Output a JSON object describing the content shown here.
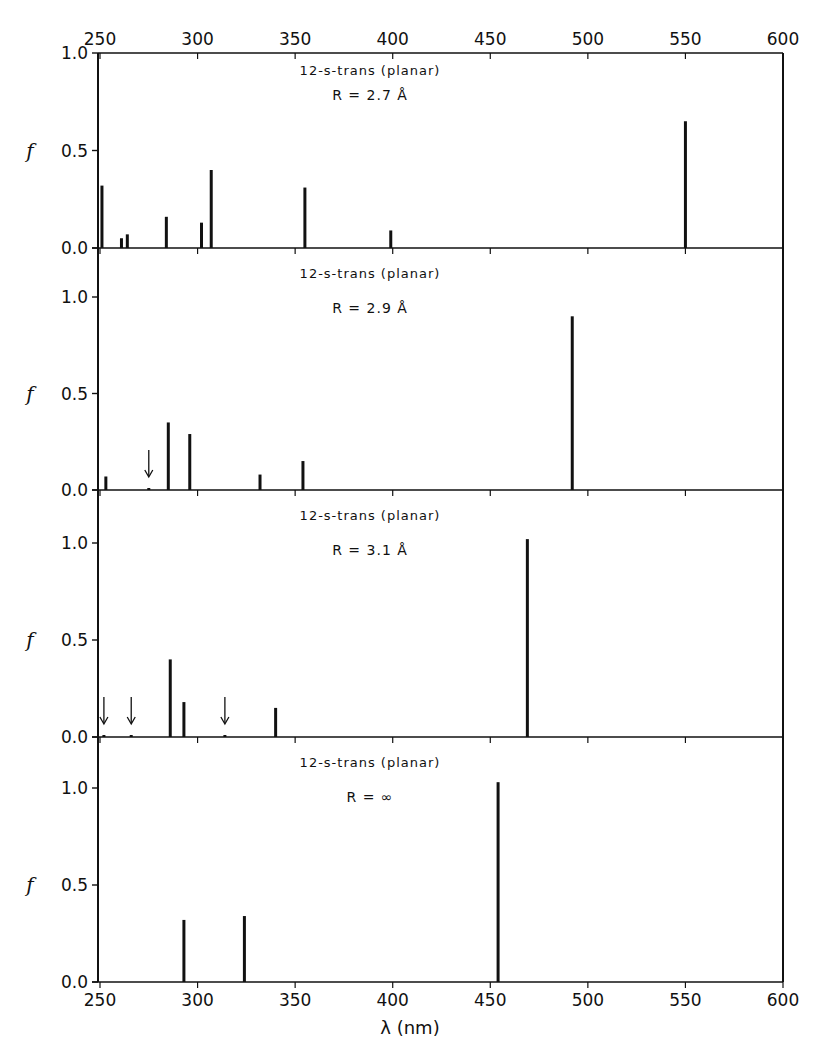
{
  "chart_data": {
    "type": "bar",
    "subtype": "stick-spectrum",
    "title": "",
    "xlabel": "λ (nm)",
    "ylabel": "f",
    "xlim": [
      250,
      600
    ],
    "x_ticks": [
      250,
      300,
      350,
      400,
      450,
      500,
      550,
      600
    ],
    "x_tick_labels": [
      "250",
      "300",
      "350",
      "400",
      "450",
      "500",
      "550",
      "600"
    ],
    "grid": false,
    "legend": null,
    "panels": [
      {
        "id": "panel-1",
        "annotation_line1": "12-s-trans (planar)",
        "annotation_line2": "R = 2.7 Å",
        "ylim": [
          0,
          1.0
        ],
        "y_ticks": [
          0.0,
          0.5,
          1.0
        ],
        "y_tick_labels": [
          "0.0",
          "0.5",
          "1.0"
        ],
        "top_x_axis_labels": true,
        "lines": [
          {
            "x": 251,
            "f": 0.32
          },
          {
            "x": 261,
            "f": 0.05
          },
          {
            "x": 264,
            "f": 0.07
          },
          {
            "x": 284,
            "f": 0.16
          },
          {
            "x": 302,
            "f": 0.13
          },
          {
            "x": 307,
            "f": 0.4
          },
          {
            "x": 355,
            "f": 0.31
          },
          {
            "x": 399,
            "f": 0.09
          },
          {
            "x": 550,
            "f": 0.65
          }
        ],
        "arrows": []
      },
      {
        "id": "panel-2",
        "annotation_line1": "12-s-trans (planar)",
        "annotation_line2": "R = 2.9 Å",
        "ylim": [
          0,
          1.2
        ],
        "y_ticks": [
          0.0,
          0.5,
          1.0
        ],
        "y_tick_labels": [
          "0.0",
          "0.5",
          "1.0"
        ],
        "lines": [
          {
            "x": 253,
            "f": 0.07
          },
          {
            "x": 275,
            "f": 0.01
          },
          {
            "x": 285,
            "f": 0.35
          },
          {
            "x": 296,
            "f": 0.29
          },
          {
            "x": 332,
            "f": 0.08
          },
          {
            "x": 354,
            "f": 0.15
          },
          {
            "x": 492,
            "f": 0.9
          }
        ],
        "arrows": [
          {
            "x": 275
          }
        ]
      },
      {
        "id": "panel-3",
        "annotation_line1": "12-s-trans (planar)",
        "annotation_line2": "R = 3.1 Å",
        "ylim": [
          0,
          1.2
        ],
        "y_ticks": [
          0.0,
          0.5,
          1.0
        ],
        "y_tick_labels": [
          "0.0",
          "0.5",
          "1.0"
        ],
        "lines": [
          {
            "x": 252,
            "f": 0.01
          },
          {
            "x": 266,
            "f": 0.01
          },
          {
            "x": 286,
            "f": 0.4
          },
          {
            "x": 293,
            "f": 0.18
          },
          {
            "x": 314,
            "f": 0.01
          },
          {
            "x": 340,
            "f": 0.15
          },
          {
            "x": 469,
            "f": 1.02
          }
        ],
        "arrows": [
          {
            "x": 252
          },
          {
            "x": 266
          },
          {
            "x": 314
          }
        ]
      },
      {
        "id": "panel-4",
        "annotation_line1": "12-s-trans (planar)",
        "annotation_line2": "R = ∞",
        "ylim": [
          0,
          1.2
        ],
        "y_ticks": [
          0.0,
          0.5,
          1.0
        ],
        "y_tick_labels": [
          "0.0",
          "0.5",
          "1.0"
        ],
        "bottom_x_axis_labels": true,
        "lines": [
          {
            "x": 293,
            "f": 0.32
          },
          {
            "x": 324,
            "f": 0.34
          },
          {
            "x": 454,
            "f": 1.03
          }
        ],
        "arrows": []
      }
    ]
  },
  "labels": {
    "ylabel": "f",
    "xlabel": "λ (nm)"
  }
}
